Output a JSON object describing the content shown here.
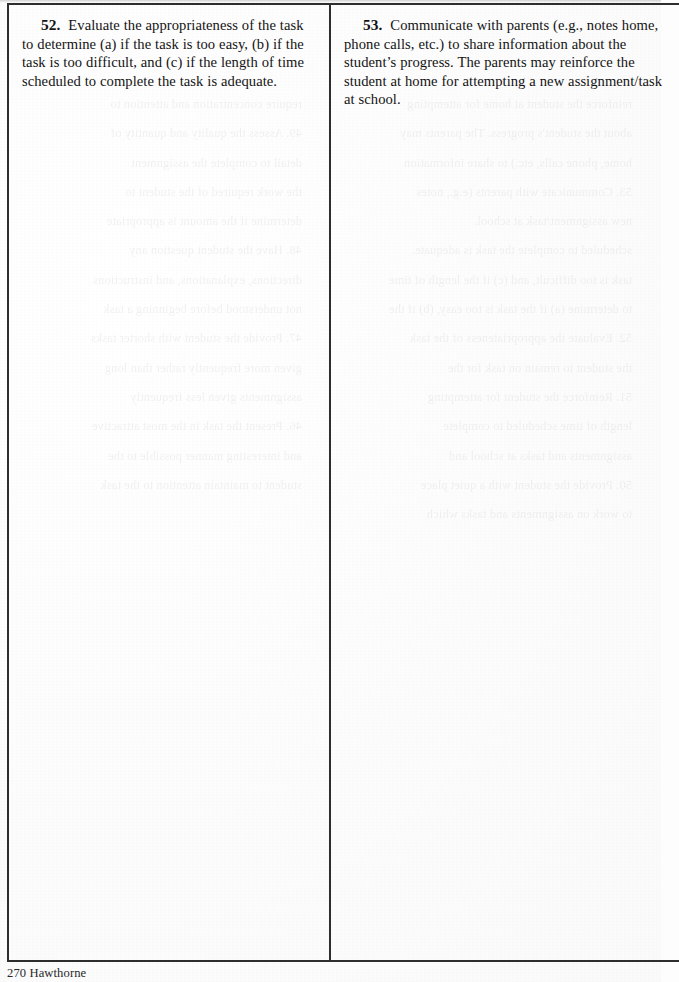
{
  "document": {
    "page_background_color": "#fdfdfd",
    "ink_color": "#141414",
    "border_color": "#2e2e2e",
    "footer": "270 Hawthorne"
  },
  "table": {
    "columns": 2,
    "cells": [
      {
        "number": "52.",
        "text": "Evaluate the appropriateness of the task to determine (a) if the task is too easy, (b) if the task is too difficult, and (c) if the length of time scheduled to complete the task is adequate."
      },
      {
        "number": "53.",
        "text": "Communicate with parents (e.g., notes home, phone calls, etc.)  to share information about the student’s progress.  The parents may reinforce the student at home for attempting a new assignment/task at school."
      }
    ]
  },
  "bleed_through": {
    "note": "faint mirrored show-through of text printed on the reverse side of the sheet",
    "lines": [
      "reinforce the student at home for attempting",
      "about the student's progress. The parents may",
      "home, phone calls, etc.) to share information",
      "53. Communicate with parents (e.g., notes",
      "new assignment/task at school.",
      "scheduled to complete the task is adequate.",
      "task is too difficult, and (c) if the length of time",
      "to determine (a) if the task is too easy, (b) if the",
      "52. Evaluate the appropriateness of the task",
      "the student to remain on task for the",
      "51. Reinforce the student for attempting",
      "length of time scheduled to complete",
      "assignments and tasks at school and",
      "50. Provide the student with a quiet place",
      "to work on assignments and tasks which",
      "require concentration and attention to",
      "49. Assess the quality and quantity of",
      "detail to complete the assignment",
      "the work required of the student to",
      "determine if the amount is appropriate",
      "48. Have the student question any",
      "directions, explanations, and instructions",
      "not understood before beginning a task",
      "47. Provide the student with shorter tasks",
      "given more frequently rather than long",
      "assignments given less frequently",
      "46. Present the task in the most attractive",
      "and interesting manner possible to the",
      "student to maintain attention to the task"
    ]
  }
}
